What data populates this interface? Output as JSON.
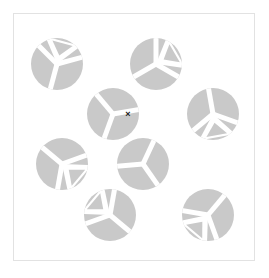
{
  "canvas": {
    "width": 269,
    "height": 278,
    "background_color": "#ffffff"
  },
  "frame": {
    "name": "stimulus-frame",
    "x": 13.5,
    "y": 13.5,
    "width": 241,
    "height": 247,
    "stroke_color": "#e2e2e2",
    "stroke_width": 1,
    "fill": "#ffffff"
  },
  "stimulus": {
    "type": "visual-search-array",
    "element_color": "#c9c9c9",
    "cutout_color": "#ffffff",
    "radius": 26,
    "count": 9,
    "items": [
      {
        "id": "disc-top-left",
        "label": "Top left disc",
        "cx": 57,
        "cy": 64,
        "rotation": 315,
        "spoke_count": 3,
        "notch_open": true
      },
      {
        "id": "disc-top-right",
        "label": "Top right disc",
        "cx": 156,
        "cy": 64,
        "rotation": 0,
        "spoke_count": 3,
        "notch_open": true
      },
      {
        "id": "disc-center-upper",
        "label": "Upper middle disc",
        "cx": 113,
        "cy": 114,
        "rotation": 200,
        "spoke_count": 3,
        "notch_open": false
      },
      {
        "id": "disc-right-upper",
        "label": "Right middle disc",
        "cx": 213,
        "cy": 114,
        "rotation": 110,
        "spoke_count": 3,
        "notch_open": true
      },
      {
        "id": "disc-left-middle",
        "label": "Left middle disc",
        "cx": 62,
        "cy": 164,
        "rotation": 70,
        "spoke_count": 3,
        "notch_open": true
      },
      {
        "id": "disc-center-lower",
        "label": "Lower middle disc",
        "cx": 143,
        "cy": 164,
        "rotation": 25,
        "spoke_count": 3,
        "notch_open": false
      },
      {
        "id": "disc-bottom-left",
        "label": "Bottom left disc",
        "cx": 110,
        "cy": 215,
        "rotation": 250,
        "spoke_count": 3,
        "notch_open": true
      },
      {
        "id": "disc-bottom-right",
        "label": "Bottom right disc",
        "cx": 208,
        "cy": 215,
        "rotation": 160,
        "spoke_count": 3,
        "notch_open": true
      },
      {
        "id": "disc-top-mid-right",
        "label": "Top middle right disc",
        "cx": 156,
        "cy": 64,
        "rotation": 0,
        "spoke_count": 3,
        "notch_open": true,
        "duplicate": true
      }
    ]
  },
  "marker": {
    "name": "x-marker",
    "glyph": "×",
    "x": 128,
    "y": 115,
    "color": "#1a1a1a",
    "size": 9
  }
}
